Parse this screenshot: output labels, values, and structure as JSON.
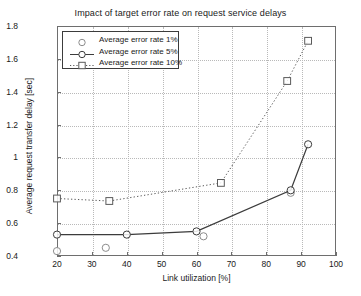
{
  "chart_data": {
    "type": "line",
    "title": "Impact of target error rate on request service delays",
    "xlabel": "Link utilization [%]",
    "ylabel": "Average request transfer delay [sec]",
    "xlim": [
      20,
      100
    ],
    "ylim": [
      0.4,
      1.8
    ],
    "xticks": [
      20,
      30,
      40,
      50,
      60,
      70,
      80,
      90,
      100
    ],
    "yticks": [
      0.4,
      0.6,
      0.8,
      1,
      1.2,
      1.4,
      1.6,
      1.8
    ],
    "ytick_labels": [
      "0.4",
      "0.6",
      "0.8",
      "1",
      "1.2",
      "1.4",
      "1.6",
      "1.8"
    ],
    "xtick_labels": [
      "20",
      "30",
      "40",
      "50",
      "60",
      "70",
      "80",
      "90",
      "100"
    ],
    "grid": true,
    "legend_position": "upper left",
    "series": [
      {
        "name": "Average error rate 1%",
        "marker": "circle",
        "line_style": "none",
        "color": "#8c8c8c",
        "points": [
          {
            "x": 20,
            "y": 0.43
          },
          {
            "x": 34,
            "y": 0.45
          },
          {
            "x": 62,
            "y": 0.52
          },
          {
            "x": 87,
            "y": 0.785
          }
        ]
      },
      {
        "name": "Average error rate 5%",
        "marker": "circle",
        "line_style": "solid",
        "color": "#3c3c3c",
        "points": [
          {
            "x": 20,
            "y": 0.53
          },
          {
            "x": 40,
            "y": 0.53
          },
          {
            "x": 60,
            "y": 0.55
          },
          {
            "x": 87,
            "y": 0.8
          },
          {
            "x": 92,
            "y": 1.08
          }
        ]
      },
      {
        "name": "Average error rate 10%",
        "marker": "square",
        "line_style": "dotted",
        "color": "#5a5a5a",
        "points": [
          {
            "x": 20,
            "y": 0.75
          },
          {
            "x": 35,
            "y": 0.735
          },
          {
            "x": 67,
            "y": 0.845
          },
          {
            "x": 86,
            "y": 1.465
          },
          {
            "x": 92,
            "y": 1.71
          }
        ]
      }
    ]
  },
  "legend": {
    "items": [
      {
        "label": "Average error rate 1%"
      },
      {
        "label": "Average error rate 5%"
      },
      {
        "label": "Average error rate 10%"
      }
    ]
  }
}
